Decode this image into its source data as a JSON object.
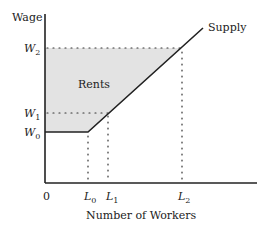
{
  "diagram": {
    "y_axis_label": "Wage",
    "x_axis_label": "Number of Workers",
    "origin_label": "0",
    "region_label": "Rents",
    "curve_label": "Supply",
    "y_ticks": [
      {
        "base": "W",
        "sub": "2"
      },
      {
        "base": "W",
        "sub": "1"
      },
      {
        "base": "W",
        "sub": "0"
      }
    ],
    "x_ticks": [
      {
        "base": "L",
        "sub": "0"
      },
      {
        "base": "L",
        "sub": "1"
      },
      {
        "base": "L",
        "sub": "2"
      }
    ],
    "colors": {
      "axis": "#222222",
      "rents_fill": "#e3e3e3",
      "dotted": "#333333"
    }
  }
}
